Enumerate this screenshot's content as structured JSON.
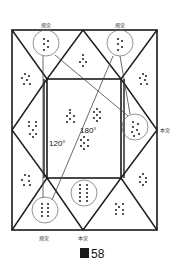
{
  "figure": {
    "caption_glyph": "圖",
    "caption_number": "58",
    "labels": {
      "top_left": "飛宮",
      "top_right": "飛宮",
      "right": "本宮",
      "bottom_left": "飛宮",
      "bottom_center": "本宮"
    },
    "angles": {
      "a120": "120°",
      "a180": "180°"
    },
    "colors": {
      "line": "#1a1a1a",
      "thin_line": "#555555",
      "dot": "#1a1a1a"
    }
  }
}
